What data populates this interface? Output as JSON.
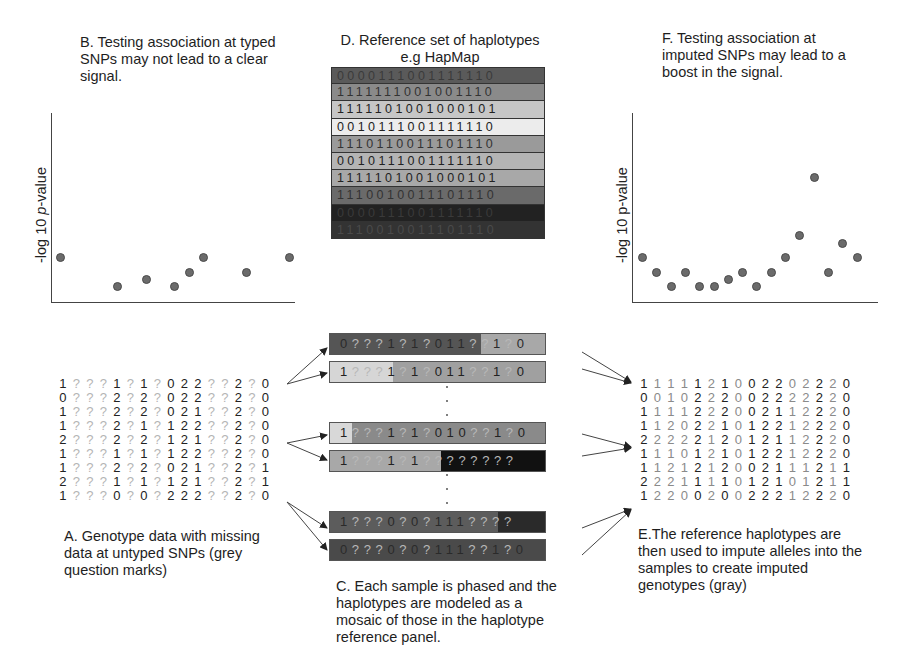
{
  "panels": {
    "B": {
      "caption": [
        "B. Testing association at typed",
        "SNPs may not lead to a clear",
        "signal."
      ]
    },
    "D": {
      "caption": [
        "D. Reference set of haplotypes",
        "e.g HapMap"
      ]
    },
    "F": {
      "caption": [
        "F. Testing association at",
        "imputed SNPs may lead to a",
        "boost in the signal."
      ]
    },
    "A": {
      "caption": [
        "A. Genotype data with missing",
        "data at untyped SNPs (grey",
        "question marks)"
      ]
    },
    "C": {
      "caption": [
        "C. Each sample is phased and the",
        "haplotypes are modeled as a",
        "mosaic of those in the haplotype",
        "reference panel."
      ]
    },
    "E": {
      "caption": [
        "E.The reference haplotypes are",
        "then used to impute alleles into the",
        "samples to create imputed",
        "genotypes (gray)"
      ]
    }
  },
  "plotB": {
    "ylabel_prefix": "-log 10 ",
    "ylabel_italic": "p",
    "ylabel_suffix": "-value"
  },
  "plotF": {
    "ylabel": "-log 10 p-value"
  },
  "chart_data": [
    {
      "type": "scatter",
      "title": "B. Testing association at typed SNPs may not lead to a clear signal.",
      "xlabel": "",
      "ylabel": "-log 10 p-value",
      "x": [
        1,
        5,
        7,
        9,
        10,
        11,
        14,
        17
      ],
      "y": [
        2,
        0,
        0.5,
        0,
        1,
        2,
        1,
        2
      ],
      "grid": false
    },
    {
      "type": "scatter",
      "title": "F. Testing association at imputed SNPs may lead to a boost in the signal.",
      "xlabel": "",
      "ylabel": "-log 10 p-value",
      "x": [
        1,
        2,
        3,
        4,
        5,
        6,
        7,
        8,
        9,
        10,
        11,
        12,
        13,
        14,
        15,
        16,
        17
      ],
      "y": [
        2,
        1,
        0,
        1,
        0,
        0,
        0.5,
        1,
        0,
        1,
        2,
        3.5,
        7.5,
        1,
        3,
        2
      ],
      "grid": false
    }
  ],
  "reference_haplotypes": {
    "rows": [
      {
        "bits": "0000111001111110",
        "color": "#5a5a5a",
        "text": "#3a3a3a"
      },
      {
        "bits": "1111111001001110",
        "color": "#8a8a8a",
        "text": "#333"
      },
      {
        "bits": "1111101001000101",
        "color": "#c6c6c6",
        "text": "#222"
      },
      {
        "bits": "0010111001111110",
        "color": "#ececec",
        "text": "#222"
      },
      {
        "bits": "1110110011101110",
        "color": "#9a9a9a",
        "text": "#333"
      },
      {
        "bits": "0010111001111110",
        "color": "#b4b4b4",
        "text": "#222"
      },
      {
        "bits": "1111101001000101",
        "color": "#a8a8a8",
        "text": "#222"
      },
      {
        "bits": "1110010011101110",
        "color": "#6a6a6a",
        "text": "#333"
      },
      {
        "bits": "0000111001111110",
        "color": "#222222",
        "text": "#3a3a3a"
      },
      {
        "bits": "1110010011101110",
        "color": "#333333",
        "text": "#4a4a4a"
      }
    ]
  },
  "sample_haplotypes": [
    {
      "text": "0???1?1?01 1??1?0",
      "segments": [
        {
          "w": 152,
          "c": "#555555"
        },
        {
          "w": 65,
          "c": "#a8a8a8"
        }
      ]
    },
    {
      "text": "1???1?1?011??1?0",
      "segments": [
        {
          "w": 64,
          "c": "#d6d6d6"
        },
        {
          "w": 153,
          "c": "#a0a0a0"
        }
      ]
    },
    {
      "text": "1???1?1?010??1?0",
      "segments": [
        {
          "w": 22,
          "c": "#d8d8d8"
        },
        {
          "w": 195,
          "c": "#8a8a8a"
        }
      ]
    },
    {
      "text": "1???1?1????????",
      "segments": [
        {
          "w": 112,
          "c": "#a8a8a8"
        },
        {
          "w": 105,
          "c": "#111111"
        }
      ]
    },
    {
      "text": "1???0?0?111????",
      "segments": [
        {
          "w": 170,
          "c": "#5c5c5c"
        },
        {
          "w": 47,
          "c": "#2a2a2a"
        }
      ]
    },
    {
      "text": "0???0?0?111??1?0",
      "segments": [
        {
          "w": 217,
          "c": "#4a4a4a"
        }
      ]
    }
  ],
  "genotypes_A": [
    "1???1?1?022??2?0",
    "0???2?2?022??2?0",
    "1???2?2?021??2?0",
    "1???2?1?122??2?0",
    "2???2?2?121??2?0",
    "1???1?1?122??2?0",
    "1???2?2?021??2?1",
    "2???1?1?121??2?1",
    "1???0?0?222??2?0"
  ],
  "genotypes_E": [
    "1111121002202220",
    "0010222002222220",
    "1111222002112220",
    "1120221012212220",
    "2222212012112220",
    "1110121012212220",
    "1121212002111211",
    "2221111012101211",
    "1220020022212220"
  ],
  "typed_columns": [
    0,
    4,
    6,
    8,
    9,
    10,
    13,
    15
  ]
}
